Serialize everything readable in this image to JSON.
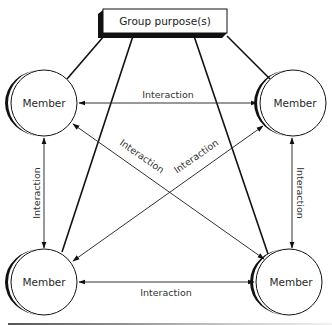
{
  "diagram": {
    "purpose_box": {
      "label": "Group purpose(s)"
    },
    "members": [
      {
        "id": "top-left",
        "label": "Member"
      },
      {
        "id": "top-right",
        "label": "Member"
      },
      {
        "id": "bottom-left",
        "label": "Member"
      },
      {
        "id": "bottom-right",
        "label": "Member"
      }
    ],
    "interactions": [
      {
        "id": "top",
        "label": "Interaction",
        "from": "top-left",
        "to": "top-right"
      },
      {
        "id": "bottom",
        "label": "Interaction",
        "from": "bottom-left",
        "to": "bottom-right"
      },
      {
        "id": "left",
        "label": "Interaction",
        "from": "top-left",
        "to": "bottom-left"
      },
      {
        "id": "right",
        "label": "Interaction",
        "from": "top-right",
        "to": "bottom-right"
      },
      {
        "id": "diag-tl-br",
        "label": "Interaction",
        "from": "top-left",
        "to": "bottom-right"
      },
      {
        "id": "diag-bl-tr",
        "label": "Interaction",
        "from": "bottom-left",
        "to": "top-right"
      }
    ],
    "colors": {
      "line": "#111111",
      "arrow_line": "#444444",
      "text": "#333333",
      "rule_start": "#555555",
      "rule_end": "#f0f0f0"
    }
  }
}
